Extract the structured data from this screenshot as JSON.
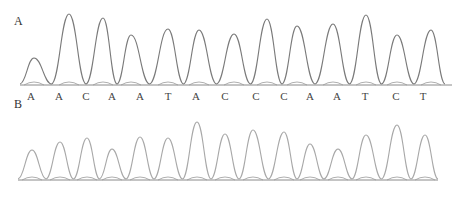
{
  "figure": {
    "panels": [
      {
        "label": "A",
        "label_pos": [
          14,
          14
        ],
        "baseline_y": 85,
        "x_start": 20,
        "x_end": 452,
        "trace_color": "#7a7a7a",
        "base_calls": [
          "A",
          "A",
          "C",
          "A",
          "A",
          "T",
          "A",
          "C",
          "C",
          "C",
          "A",
          "A",
          "T",
          "C",
          "T"
        ],
        "base_call_x": [
          31,
          59,
          86,
          112,
          140,
          168,
          196,
          225,
          256,
          284,
          310,
          337,
          365,
          396,
          423
        ],
        "base_call_y": 90,
        "peaks": [
          {
            "x": 34,
            "y": 58
          },
          {
            "x": 69,
            "y": 14
          },
          {
            "x": 103,
            "y": 18
          },
          {
            "x": 131,
            "y": 35
          },
          {
            "x": 168,
            "y": 29
          },
          {
            "x": 199,
            "y": 30
          },
          {
            "x": 234,
            "y": 34
          },
          {
            "x": 267,
            "y": 19
          },
          {
            "x": 297,
            "y": 26
          },
          {
            "x": 333,
            "y": 24
          },
          {
            "x": 366,
            "y": 15
          },
          {
            "x": 397,
            "y": 35
          },
          {
            "x": 431,
            "y": 30
          }
        ]
      },
      {
        "label": "B",
        "label_pos": [
          14,
          97
        ],
        "baseline_y": 180,
        "x_start": 18,
        "x_end": 438,
        "trace_color": "#a8a8a8",
        "base_calls": [],
        "peaks": [
          {
            "x": 32,
            "y": 150
          },
          {
            "x": 60,
            "y": 142
          },
          {
            "x": 87,
            "y": 138
          },
          {
            "x": 112,
            "y": 149
          },
          {
            "x": 140,
            "y": 137
          },
          {
            "x": 168,
            "y": 138
          },
          {
            "x": 197,
            "y": 122
          },
          {
            "x": 225,
            "y": 134
          },
          {
            "x": 253,
            "y": 130
          },
          {
            "x": 284,
            "y": 132
          },
          {
            "x": 310,
            "y": 144
          },
          {
            "x": 338,
            "y": 149
          },
          {
            "x": 366,
            "y": 135
          },
          {
            "x": 397,
            "y": 125
          },
          {
            "x": 425,
            "y": 135
          }
        ]
      }
    ]
  }
}
